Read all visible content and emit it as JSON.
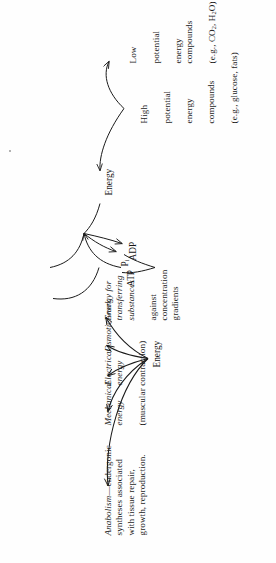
{
  "figure": {
    "orientation": "rotated-90-ccw",
    "ink_color": "#1a1a1a",
    "background_color": "#fefefe"
  },
  "nodes": {
    "energy_top": "Energy",
    "energy_mid": "Energy",
    "atp": "ATP",
    "adp": "ADP",
    "pi_main": "P",
    "pi_sub": "i"
  },
  "sources": {
    "high": {
      "line1": "High",
      "line2": "potential",
      "line3": "energy",
      "line4": "compounds",
      "line5": "(e.g., glucose, fats)",
      "full": "High potential energy compounds (e.g., glucose, fats)"
    },
    "low": {
      "line1": "Low",
      "line2": "potential",
      "line3": "energy compounds",
      "line4_pre": "(e.g., CO",
      "line4_sub1": "2",
      "line4_mid": ", H",
      "line4_sub2": "2",
      "line4_post": "O)",
      "full": "Low potential energy compounds (e.g., CO2, H2O)"
    }
  },
  "outputs": [
    {
      "id": "anabolism",
      "italic_part": "Anabolism",
      "rest": "—endergonic\nsyntheses associated\nwith tissue repair,\ngrowth, reproduction.",
      "full": "Anabolism—endergonic syntheses associated with tissue repair, growth, reproduction."
    },
    {
      "id": "mechanical",
      "italic_part": "Mechanical\nenergy",
      "rest": "(muscular contraction)",
      "full": "Mechanical energy (muscular contraction)"
    },
    {
      "id": "electrical",
      "italic_part": "Electrical\nenergy",
      "rest": "",
      "full": "Electrical energy"
    },
    {
      "id": "osmotic",
      "italic_part": "Osmotic work",
      "rest": "",
      "full": "Osmotic work"
    },
    {
      "id": "transport",
      "italic_part": "Energy for\ntransferring\nsubstances",
      "rest": "against\nconcentration\ngradients",
      "full": "Energy for transferring substances against concentration gradients"
    }
  ]
}
